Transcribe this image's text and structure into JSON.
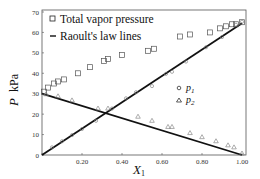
{
  "chart_data": {
    "type": "scatter",
    "title": "",
    "xlabel": "X1",
    "ylabel": "P kPa",
    "xlim": [
      0,
      1.0
    ],
    "ylim": [
      0,
      70
    ],
    "x_ticks": [
      "0",
      "0.20",
      "0.40",
      "0.60",
      "0.80",
      "1.00"
    ],
    "y_ticks": [
      "0",
      "10",
      "20",
      "30",
      "40",
      "50",
      "60",
      "70"
    ],
    "grid": false,
    "legend": {
      "position": "upper-left",
      "entries": [
        "Total vapor pressure",
        "Raoult's law lines"
      ],
      "inset_entries": [
        "p1",
        "p2"
      ]
    },
    "series": [
      {
        "name": "Total vapor pressure",
        "marker": "square",
        "x": [
          0.01,
          0.03,
          0.06,
          0.08,
          0.11,
          0.18,
          0.24,
          0.31,
          0.33,
          0.4,
          0.53,
          0.56,
          0.69,
          0.74,
          0.84,
          0.89,
          0.92,
          0.95,
          0.97,
          1.0
        ],
        "y": [
          31,
          33,
          35,
          36,
          37,
          40,
          43,
          46,
          47,
          49,
          51,
          52,
          58,
          59,
          60,
          62,
          63,
          64,
          64,
          65
        ]
      },
      {
        "name": "p1",
        "marker": "diamond",
        "x": [
          0.05,
          0.1,
          0.15,
          0.2,
          0.27,
          0.35,
          0.42,
          0.47,
          0.55,
          0.62,
          0.65,
          0.72,
          0.82,
          0.9,
          0.97,
          1.0
        ],
        "y": [
          3,
          6,
          9,
          12,
          16,
          22,
          27,
          30,
          33,
          39,
          40,
          45,
          52,
          57,
          63,
          64.5
        ]
      },
      {
        "name": "p2",
        "marker": "triangle",
        "x": [
          0.02,
          0.08,
          0.15,
          0.28,
          0.33,
          0.48,
          0.55,
          0.63,
          0.65,
          0.74,
          0.8,
          0.87,
          0.93,
          0.96,
          1.0
        ],
        "y": [
          29,
          28,
          26,
          22,
          22,
          18,
          16,
          13,
          13,
          10,
          8,
          6,
          4,
          3,
          0
        ]
      },
      {
        "name": "Raoult's law line p1",
        "type": "line",
        "x": [
          0,
          1.0
        ],
        "y": [
          0,
          64.5
        ]
      },
      {
        "name": "Raoult's law line p2",
        "type": "line",
        "x": [
          0,
          1.0
        ],
        "y": [
          30,
          0
        ]
      }
    ]
  },
  "labels": {
    "legend_total": "Total vapor pressure",
    "legend_raoult": "Raoult's law lines",
    "p1_symbol": "p",
    "p1_sub": "1",
    "p2_symbol": "p",
    "p2_sub": "2",
    "x_axis_symbol": "X",
    "x_axis_sub": "1",
    "y_axis_symbol": "P",
    "y_axis_unit": "kPa"
  }
}
